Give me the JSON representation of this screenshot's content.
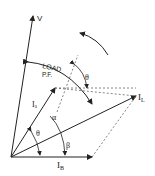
{
  "diagram": {
    "type": "phasor-diagram",
    "labels": {
      "v": "V",
      "load": "LOAD",
      "pf": "P.F.",
      "theta_top": "θ",
      "i_a": "Iₐ",
      "alpha": "α",
      "theta_bottom": "θ",
      "beta": "β",
      "i_l": "I",
      "i_l_sub": "L",
      "i_b": "I",
      "i_b_sub": "B"
    },
    "colors": {
      "line": "#222222",
      "dashed": "#555555",
      "background": "#ffffff"
    }
  }
}
